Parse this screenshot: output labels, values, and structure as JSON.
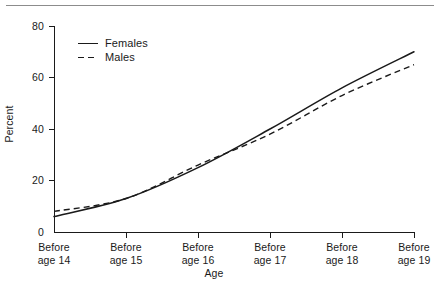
{
  "chart_data": {
    "type": "line",
    "title": "",
    "xlabel": "Age",
    "ylabel": "Percent",
    "categories": [
      "Before age 14",
      "Before age 15",
      "Before age 16",
      "Before age 17",
      "Before age 18",
      "Before age 19"
    ],
    "category_lines": [
      [
        "Before",
        "age 14"
      ],
      [
        "Before",
        "age 15"
      ],
      [
        "Before",
        "age 16"
      ],
      [
        "Before",
        "age 17"
      ],
      [
        "Before",
        "age 18"
      ],
      [
        "Before",
        "age 19"
      ]
    ],
    "series": [
      {
        "name": "Females",
        "style": "solid",
        "color": "#1a1a1a",
        "values": [
          6,
          13,
          25,
          40,
          56,
          70
        ]
      },
      {
        "name": "Males",
        "style": "dashed",
        "color": "#1a1a1a",
        "values": [
          8,
          13,
          26,
          38,
          53,
          65
        ]
      }
    ],
    "ylim": [
      0,
      80
    ],
    "yticks": [
      0,
      20,
      40,
      60,
      80
    ],
    "ytick_labels": [
      "0",
      "20",
      "40",
      "60",
      "80"
    ],
    "grid": false,
    "legend_position": "upper-left-inside"
  },
  "axes": {
    "y_label": "Percent",
    "x_label": "Age",
    "y_ticks": [
      "80",
      "60",
      "40",
      "20",
      "0"
    ]
  },
  "legend": {
    "items": [
      {
        "label": "Females",
        "style": "solid"
      },
      {
        "label": "Males",
        "style": "dashed"
      }
    ]
  }
}
